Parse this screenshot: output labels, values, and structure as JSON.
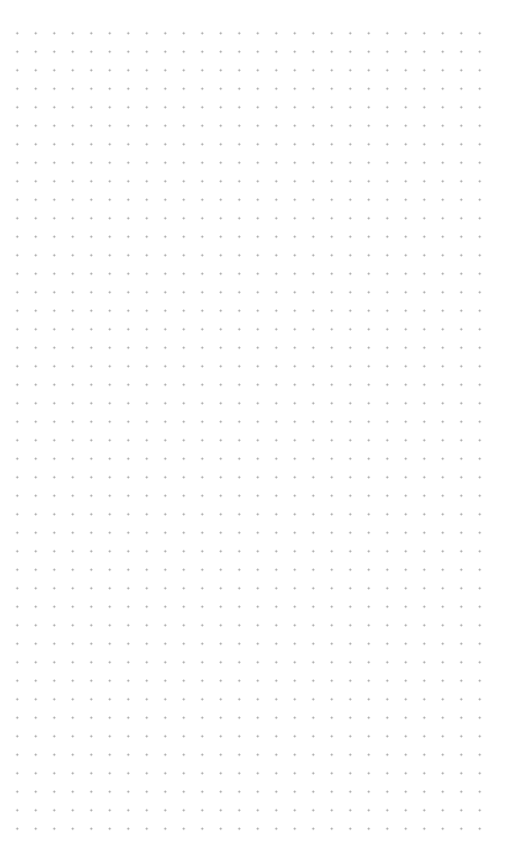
{
  "canvas": {
    "type": "dot-grid",
    "columns": 26,
    "rows": 44,
    "spacing_px": 18.5,
    "dot_color": "#9a9a9a",
    "background_color": "#ffffff"
  }
}
